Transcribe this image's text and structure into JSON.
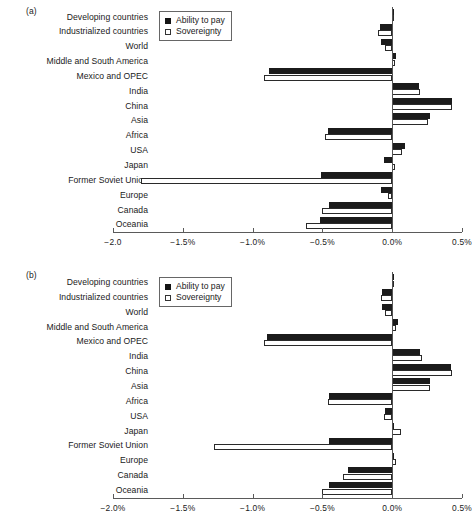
{
  "figure": {
    "panels": [
      {
        "tag": "(a)",
        "legend": {
          "items": [
            {
              "label": "Ability to pay",
              "style": "dark"
            },
            {
              "label": "Sovereignty",
              "style": "light"
            }
          ]
        },
        "axis": {
          "ticks": [
            "-2.0",
            "-1.5%",
            "-1.0%",
            "-0.5%",
            "0.0%",
            "0.5%"
          ],
          "tick_values": [
            -2.0,
            -1.5,
            -1.0,
            -0.5,
            0.0,
            0.5
          ],
          "xlim": [
            -2.0,
            0.5
          ]
        }
      },
      {
        "tag": "(b)",
        "legend": {
          "items": [
            {
              "label": "Ability to pay",
              "style": "dark"
            },
            {
              "label": "Sovereignty",
              "style": "light"
            }
          ]
        },
        "axis": {
          "ticks": [
            "-2.0%",
            "-1.5%",
            "-1.0%",
            "-0.5%",
            "0.0%",
            "0.5%"
          ],
          "tick_values": [
            -2.0,
            -1.5,
            -1.0,
            -0.5,
            0.0,
            0.5
          ],
          "xlim": [
            -2.0,
            0.5
          ]
        }
      }
    ]
  },
  "chart_data": [
    {
      "type": "bar",
      "orientation": "horizontal",
      "title": "(a)",
      "xlabel": "",
      "ylabel": "",
      "xlim": [
        -2.0,
        0.5
      ],
      "xticks": [
        -2.0,
        -1.5,
        -1.0,
        -0.5,
        0.0,
        0.5
      ],
      "xticklabels": [
        "-2.0",
        "-1.5%",
        "-1.0%",
        "-0.5%",
        "0.0%",
        "0.5%"
      ],
      "grid": false,
      "legend_position": "upper-left-inside",
      "categories": [
        "Developing countries",
        "Industrialized countries",
        "World",
        "Middle and South America",
        "Mexico and OPEC",
        "India",
        "China",
        "Asia",
        "Africa",
        "USA",
        "Japan",
        "Former Soviet Union",
        "Europe",
        "Canada",
        "Oceania"
      ],
      "series": [
        {
          "name": "Ability to pay",
          "color": "#1b1b1b",
          "values": [
            0.01,
            -0.09,
            -0.08,
            0.03,
            -0.88,
            0.19,
            0.43,
            0.27,
            -0.46,
            0.09,
            -0.06,
            -0.51,
            -0.08,
            -0.45,
            -0.52
          ]
        },
        {
          "name": "Sovereignty",
          "color": "#ffffff",
          "values": [
            0.0,
            -0.1,
            -0.05,
            0.02,
            -0.92,
            0.2,
            0.43,
            0.26,
            -0.48,
            0.07,
            0.02,
            -1.8,
            -0.03,
            -0.5,
            -0.62
          ]
        }
      ]
    },
    {
      "type": "bar",
      "orientation": "horizontal",
      "title": "(b)",
      "xlabel": "",
      "ylabel": "",
      "xlim": [
        -2.0,
        0.5
      ],
      "xticks": [
        -2.0,
        -1.5,
        -1.0,
        -0.5,
        0.0,
        0.5
      ],
      "xticklabels": [
        "-2.0%",
        "-1.5%",
        "-1.0%",
        "-0.5%",
        "0.0%",
        "0.5%"
      ],
      "grid": false,
      "legend_position": "upper-left-inside",
      "categories": [
        "Developing countries",
        "Industrialized countries",
        "World",
        "Middle and South America",
        "Mexico and OPEC",
        "India",
        "China",
        "Asia",
        "Africa",
        "USA",
        "Japan",
        "Former Soviet Union",
        "Europe",
        "Canada",
        "Oceania"
      ],
      "series": [
        {
          "name": "Ability to pay",
          "color": "#1b1b1b",
          "values": [
            0.01,
            -0.07,
            -0.07,
            0.04,
            -0.9,
            0.2,
            0.42,
            0.27,
            -0.45,
            -0.05,
            0.0,
            -0.45,
            0.0,
            -0.32,
            -0.45
          ]
        },
        {
          "name": "Sovereignty",
          "color": "#ffffff",
          "values": [
            0.0,
            -0.08,
            -0.05,
            0.03,
            -0.92,
            0.21,
            0.43,
            0.27,
            -0.46,
            -0.06,
            0.06,
            -1.28,
            0.03,
            -0.35,
            -0.5
          ]
        }
      ]
    }
  ]
}
